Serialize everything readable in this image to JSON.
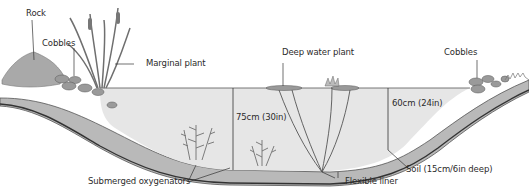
{
  "labels": {
    "rock": "Rock",
    "cobbles_left": "Cobbles",
    "marginal_plant": "Marginal plant",
    "deep_water_plant": "Deep water plant",
    "cobbles_right": "Cobbles",
    "depth_deep": "75cm (30in)",
    "depth_shallow": "60cm (24in)",
    "submerged_oxygenators": "Submerged oxygenators",
    "flexible_liner": "Flexible liner",
    "soil": "Soil (15cm/6in deep)"
  },
  "colors": {
    "water": "#e6e6e6",
    "soil": "#b9b9b9",
    "soil_dark": "#7a7a7a",
    "rock": "#a9a9a9",
    "plant": "#6f6f6f",
    "line": "#3a3a3a"
  }
}
